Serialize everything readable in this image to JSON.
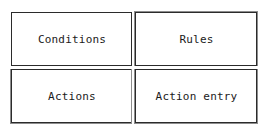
{
  "diagram": {
    "type": "grid-2x2",
    "background_color": "#ffffff",
    "border_color": "#2b2b2b",
    "secondary_border_color": "#8d8d8d",
    "text_color": "#1a1a1a",
    "columns": 2,
    "rows": 2,
    "cells": [
      {
        "id": "conditions",
        "label": "Conditions",
        "row": 1,
        "column": 1
      },
      {
        "id": "rules",
        "label": "Rules",
        "row": 1,
        "column": 2
      },
      {
        "id": "actions",
        "label": "Actions",
        "row": 2,
        "column": 1
      },
      {
        "id": "action-entry",
        "label": "Action entry",
        "row": 2,
        "column": 2
      }
    ]
  }
}
